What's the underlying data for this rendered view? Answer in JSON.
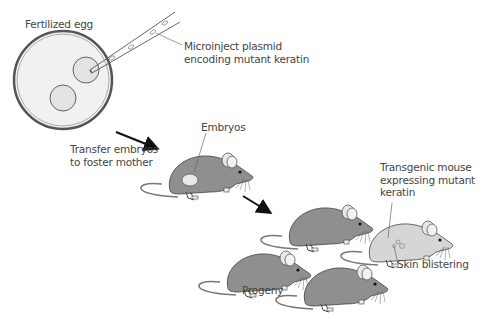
{
  "diagram": {
    "labels": {
      "fertilized_egg": "Fertilized egg",
      "microinject_line1": "Microinject plasmid",
      "microinject_line2": "encoding mutant keratin",
      "transfer_line1": "Transfer embryos",
      "transfer_line2": "to foster mother",
      "embryos": "Embryos",
      "transgenic_line1": "Transgenic mouse",
      "transgenic_line2": "expressing mutant",
      "transgenic_line3": "keratin",
      "skin_blistering": "Skin blistering",
      "progeny": "Progeny"
    },
    "colors": {
      "mouse_body": "#8f8f8f",
      "mouse_transgenic": "#d6d6d6",
      "egg_fill": "#f0f0f0",
      "nucleus_fill": "#e2e2e2",
      "line": "#555555",
      "arrow": "#111111"
    },
    "flow": [
      {
        "step": 1,
        "label": "Fertilized egg"
      },
      {
        "step": 2,
        "label": "Microinject plasmid encoding mutant keratin"
      },
      {
        "step": 3,
        "label": "Transfer embryos to foster mother"
      },
      {
        "step": 4,
        "label": "Progeny"
      },
      {
        "step": 5,
        "label": "Transgenic mouse expressing mutant keratin"
      }
    ]
  }
}
